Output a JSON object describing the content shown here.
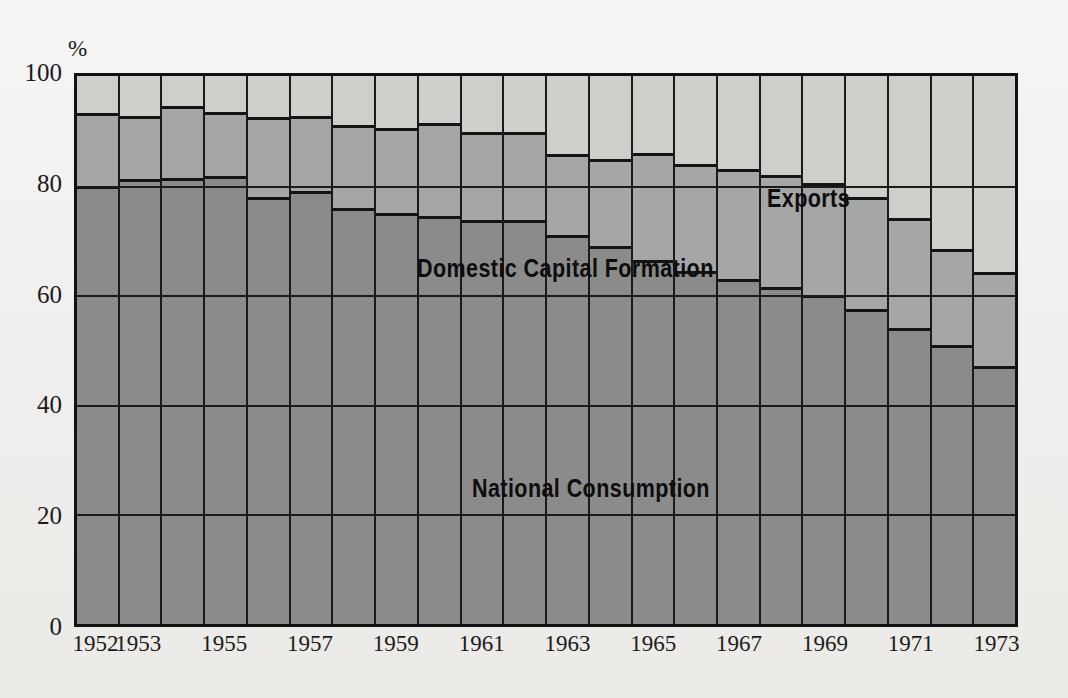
{
  "title": "",
  "axes": {
    "y_unit": "%",
    "y_ticks": [
      0,
      20,
      40,
      60,
      80,
      100
    ],
    "y_tick_labels": [
      "0",
      "20",
      "40",
      "60",
      "80",
      "100"
    ],
    "x_tick_labels": [
      "1952",
      "1953",
      "1955",
      "1957",
      "1959",
      "1961",
      "1963",
      "1965",
      "1967",
      "1969",
      "1971",
      "1973"
    ]
  },
  "labels": {
    "exports": "Exports",
    "capital": "Domestic  Capital  Formation",
    "consumption": "National  Consumption"
  },
  "colors": {
    "consumption": "#8b8b8b",
    "capital": "#a6a6a6",
    "exports": "#cfcecb",
    "axis": "#111111",
    "text": "#1b1b1b",
    "background": "#f1f0ee"
  },
  "chart_data": {
    "type": "bar",
    "stacked": true,
    "normalized": true,
    "title": "",
    "xlabel": "",
    "ylabel": "%",
    "ylim": [
      0,
      100
    ],
    "grid": true,
    "legend_position": "in-plot",
    "categories": [
      "1952",
      "1953",
      "1954",
      "1955",
      "1956",
      "1957",
      "1958",
      "1959",
      "1960",
      "1961",
      "1962",
      "1963",
      "1964",
      "1965",
      "1966",
      "1967",
      "1968",
      "1969",
      "1970",
      "1971",
      "1972",
      "1973"
    ],
    "series": [
      {
        "name": "National Consumption",
        "values": [
          80.0,
          81.2,
          81.3,
          81.7,
          78.0,
          79.0,
          76.0,
          75.0,
          74.5,
          73.8,
          73.7,
          71.0,
          69.0,
          66.5,
          64.5,
          63.0,
          61.5,
          60.0,
          57.5,
          54.0,
          51.0,
          47.0
        ]
      },
      {
        "name": "Domestic Capital Formation",
        "values": [
          13.3,
          11.5,
          13.3,
          11.8,
          14.6,
          13.7,
          15.0,
          15.5,
          17.0,
          16.0,
          16.0,
          14.7,
          15.8,
          19.5,
          19.5,
          20.0,
          20.5,
          20.5,
          20.5,
          20.0,
          17.5,
          17.3
        ]
      },
      {
        "name": "Exports",
        "values": [
          6.7,
          7.3,
          5.4,
          6.5,
          7.4,
          7.3,
          9.0,
          9.5,
          8.5,
          10.2,
          10.3,
          14.3,
          15.2,
          14.0,
          16.0,
          17.0,
          18.0,
          19.5,
          22.0,
          26.0,
          31.5,
          35.7
        ]
      }
    ],
    "cumulative_boundaries": {
      "description": "Top of National Consumption and top of Domestic Capital Formation, as % of total",
      "consumption_top": [
        80.0,
        81.2,
        81.3,
        81.7,
        78.0,
        79.0,
        76.0,
        75.0,
        74.5,
        73.8,
        73.7,
        71.0,
        69.0,
        66.5,
        64.5,
        63.0,
        61.5,
        60.0,
        57.5,
        54.0,
        51.0,
        47.0
      ],
      "capital_top": [
        93.3,
        92.7,
        94.6,
        93.5,
        92.6,
        92.7,
        91.0,
        90.5,
        91.5,
        89.8,
        89.7,
        85.7,
        84.8,
        86.0,
        84.0,
        83.0,
        82.0,
        80.5,
        78.0,
        74.0,
        68.5,
        64.3
      ]
    }
  }
}
